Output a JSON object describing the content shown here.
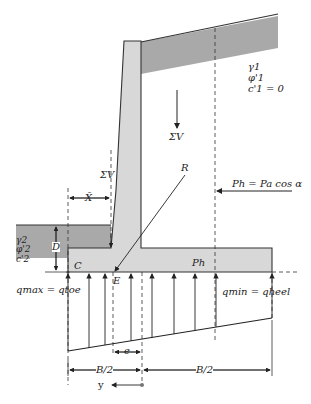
{
  "diagram": {
    "type": "cantilever-retaining-wall-pressure-diagram",
    "colors": {
      "concrete": "#d8d8d8",
      "soil": "#a9a9a9",
      "line": "#333333",
      "background": "#ffffff"
    },
    "labels": {
      "backfill_gamma": "γ1",
      "backfill_phi": "φ'1",
      "backfill_c": "c'1 = 0",
      "sum_v_top": "ΣV",
      "sum_v_left": "ΣV",
      "x_bar": "X̄",
      "resultant": "R",
      "ph_eq": "Ph = Pa cos α",
      "ph_inner": "Ph",
      "depth": "D",
      "point_c": "C",
      "point_e": "E",
      "front_gamma": "γ2",
      "front_phi": "φ'2",
      "front_c": "c'2",
      "q_max": "qmax = qtoe",
      "q_min": "qmin = qheel",
      "eccentricity": "e",
      "half_b_left": "B/2",
      "half_b_right": "B/2",
      "y_axis": "y"
    }
  }
}
